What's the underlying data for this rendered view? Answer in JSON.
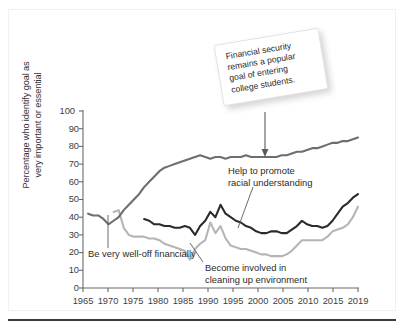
{
  "figure": {
    "callout_text": "Financial security remains a popular goal of entering college students."
  },
  "annotations": {
    "financial": "Be very well-off financially",
    "racial_line1": "Help to promote",
    "racial_line2": "racial understanding",
    "environment_line1": "Become involved in",
    "environment_line2": "cleaning up environment"
  },
  "axis": {
    "ylabel_line1": "Percentage who identify goal as",
    "ylabel_line2": "very important or essential",
    "yticks": [
      "0",
      "10",
      "20",
      "30",
      "40",
      "50",
      "60",
      "70",
      "80",
      "90",
      "100"
    ],
    "xticks": [
      "1965",
      "1970",
      "1975",
      "1980",
      "1985",
      "1990",
      "1995",
      "2000",
      "2005",
      "2010",
      "2015",
      "2019"
    ]
  },
  "colors": {
    "financial": "#6e6e6e",
    "racial": "#2b2b2b",
    "environment": "#b5b5b5",
    "axis": "#6a6a6a",
    "rule": "#3a3a3a"
  },
  "chart_data": {
    "type": "line",
    "title": "",
    "xlabel": "",
    "ylabel": "Percentage who identify goal as very important or essential",
    "xlim": [
      1965,
      2019
    ],
    "ylim": [
      0,
      100
    ],
    "grid": false,
    "legend": "none (direct labels)",
    "xticks": [
      1965,
      1970,
      1975,
      1980,
      1985,
      1990,
      1995,
      2000,
      2005,
      2010,
      2015,
      2019
    ],
    "yticks": [
      0,
      10,
      20,
      30,
      40,
      50,
      60,
      70,
      80,
      90,
      100
    ],
    "annotations": [
      {
        "text": "Financial security remains a popular goal of entering college students.",
        "points_to_series": "Be very well-off financially",
        "points_to_x": 1999,
        "points_to_y": 74
      },
      {
        "text": "Be very well-off financially",
        "points_to_series": "Be very well-off financially",
        "points_to_x": 1970,
        "points_to_y": 36
      },
      {
        "text": "Help to promote racial understanding",
        "points_to_series": "Help to promote racial understanding",
        "points_to_x": 1999,
        "points_to_y": 31
      },
      {
        "text": "Become involved in cleaning up environment",
        "points_to_series": "Become involved in cleaning up environment",
        "points_to_x": 1987,
        "points_to_y": 22
      }
    ],
    "series": [
      {
        "name": "Be very well-off financially",
        "color": "#6e6e6e",
        "x": [
          1966,
          1967,
          1968,
          1969,
          1970,
          1971,
          1972,
          1973,
          1974,
          1975,
          1976,
          1977,
          1978,
          1979,
          1980,
          1981,
          1982,
          1983,
          1984,
          1985,
          1986,
          1987,
          1988,
          1989,
          1990,
          1991,
          1992,
          1993,
          1994,
          1995,
          1996,
          1997,
          1998,
          1999,
          2000,
          2001,
          2002,
          2003,
          2004,
          2005,
          2006,
          2007,
          2008,
          2009,
          2010,
          2011,
          2012,
          2013,
          2014,
          2015,
          2016,
          2017,
          2018,
          2019
        ],
        "values": [
          42,
          41,
          41,
          39,
          36,
          38,
          40,
          44,
          47,
          50,
          53,
          57,
          60,
          63,
          66,
          68,
          69,
          70,
          71,
          72,
          73,
          74,
          75,
          74,
          73,
          74,
          74,
          73,
          74,
          74,
          74,
          75,
          74,
          74,
          74,
          74,
          74,
          74,
          75,
          75,
          76,
          77,
          77,
          78,
          79,
          79,
          80,
          81,
          82,
          82,
          83,
          83,
          84,
          85
        ]
      },
      {
        "name": "Help to promote racial understanding",
        "color": "#2b2b2b",
        "x": [
          1977,
          1978,
          1979,
          1980,
          1981,
          1982,
          1983,
          1984,
          1985,
          1986,
          1987,
          1988,
          1989,
          1990,
          1991,
          1992,
          1993,
          1994,
          1995,
          1996,
          1997,
          1998,
          1999,
          2000,
          2001,
          2002,
          2003,
          2004,
          2005,
          2006,
          2007,
          2008,
          2009,
          2010,
          2011,
          2012,
          2013,
          2014,
          2015,
          2016,
          2017,
          2018,
          2019
        ],
        "values": [
          39,
          38,
          36,
          36,
          35,
          35,
          34,
          34,
          35,
          34,
          30,
          35,
          38,
          43,
          40,
          47,
          42,
          40,
          38,
          37,
          35,
          34,
          32,
          31,
          31,
          32,
          32,
          31,
          31,
          33,
          35,
          38,
          36,
          35,
          35,
          34,
          35,
          38,
          42,
          46,
          48,
          51,
          53
        ]
      },
      {
        "name": "Become involved in cleaning up environment",
        "color": "#b5b5b5",
        "x": [
          1971,
          1972,
          1973,
          1974,
          1975,
          1976,
          1977,
          1978,
          1979,
          1980,
          1981,
          1982,
          1983,
          1984,
          1985,
          1986,
          1987,
          1988,
          1989,
          1990,
          1991,
          1992,
          1993,
          1994,
          1995,
          1996,
          1997,
          1998,
          1999,
          2000,
          2001,
          2002,
          2003,
          2004,
          2005,
          2006,
          2007,
          2008,
          2009,
          2010,
          2011,
          2012,
          2013,
          2014,
          2015,
          2016,
          2017,
          2018,
          2019
        ],
        "values": [
          43,
          44,
          34,
          30,
          29,
          29,
          29,
          28,
          28,
          27,
          25,
          24,
          23,
          22,
          21,
          16,
          22,
          25,
          27,
          37,
          31,
          35,
          28,
          24,
          23,
          22,
          22,
          21,
          20,
          19,
          19,
          18,
          18,
          18,
          19,
          21,
          24,
          27,
          27,
          27,
          27,
          27,
          29,
          32,
          33,
          34,
          36,
          40,
          46
        ]
      }
    ]
  }
}
